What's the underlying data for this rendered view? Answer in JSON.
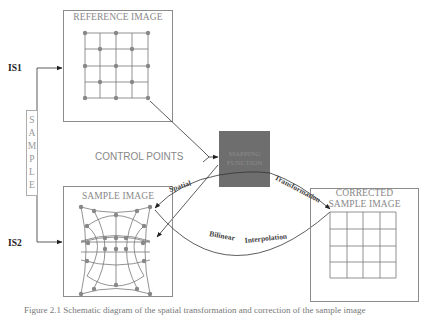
{
  "diagram": {
    "labels": {
      "is1": "IS1",
      "is2": "IS2",
      "sample_vertical": [
        "S",
        "A",
        "M",
        "P",
        "L",
        "E"
      ],
      "reference_image": "REFERENCE IMAGE",
      "control_points": "CONTROL POINTS",
      "mapping_function_line1": "MAPPING",
      "mapping_function_line2": "FUNCTION",
      "sample_image": "SAMPLE IMAGE",
      "corrected_line1": "CORRECTED",
      "corrected_line2": "SAMPLE IMAGE",
      "arc_top_left": "Spatial",
      "arc_top_right": "Transformation",
      "arc_bottom_left": "Bilinear",
      "arc_bottom_right": "Interpolation"
    },
    "caption": "Figure 2.1  Schematic diagram of the spatial transformation and correction of the sample image",
    "colors": {
      "mapping_fill": "#6e6e6e",
      "box_stroke": "#8c8c8c",
      "grid_stroke": "#777777",
      "dot_fill": "#888888",
      "arrow_stroke": "#333333"
    }
  }
}
